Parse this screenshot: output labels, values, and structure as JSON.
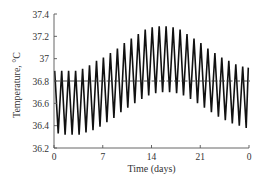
{
  "chart_data": {
    "type": "line",
    "title": "",
    "xlabel": "Time (days)",
    "ylabel": "Temperature, °C",
    "xlim": [
      0,
      28
    ],
    "ylim": [
      36.2,
      37.4
    ],
    "x_ticks": [
      0,
      7,
      14,
      21,
      28
    ],
    "x_tick_labels": [
      "0",
      "7",
      "14",
      "21",
      "0"
    ],
    "y_ticks": [
      36.2,
      36.4,
      36.6,
      36.8,
      37.0,
      37.2,
      37.4
    ],
    "y_tick_labels": [
      "36.2",
      "36.4",
      "36.6",
      "36.8",
      "37",
      "37.2",
      "37.4"
    ],
    "grid": false,
    "legend": null,
    "reference_line": {
      "y": 36.8,
      "style": "dashed"
    },
    "series": [
      {
        "name": "Daily oscillating body temperature",
        "cycles_per_day": 1,
        "description": "Circadian oscillation (1 cycle/day) over a 28-day cycle; daily peak and trough envelope values per day",
        "day": [
          0,
          1,
          2,
          3,
          4,
          5,
          6,
          7,
          8,
          9,
          10,
          11,
          12,
          13,
          14,
          15,
          16,
          17,
          18,
          19,
          20,
          21,
          22,
          23,
          24,
          25,
          26,
          27,
          28
        ],
        "daily_max": [
          36.89,
          36.89,
          36.89,
          36.89,
          36.91,
          36.94,
          36.98,
          37.01,
          37.05,
          37.09,
          37.14,
          37.18,
          37.22,
          37.26,
          37.28,
          37.29,
          37.29,
          37.28,
          37.26,
          37.22,
          37.18,
          37.14,
          37.09,
          37.05,
          37.01,
          36.98,
          36.95,
          36.93,
          36.92
        ],
        "daily_min": [
          36.33,
          36.32,
          36.32,
          36.32,
          36.34,
          36.36,
          36.39,
          36.43,
          36.47,
          36.52,
          36.56,
          36.6,
          36.64,
          36.67,
          36.69,
          36.7,
          36.7,
          36.69,
          36.67,
          36.64,
          36.6,
          36.56,
          36.52,
          36.48,
          36.45,
          36.42,
          36.4,
          36.38,
          36.37
        ]
      }
    ]
  }
}
